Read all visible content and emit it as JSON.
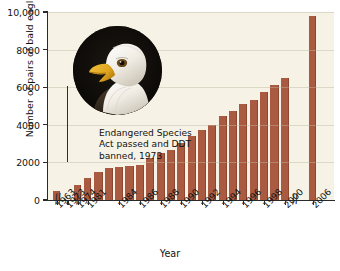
{
  "chart_data": {
    "type": "bar",
    "title": "",
    "xlabel": "Year",
    "ylabel": "Number of pairs of bald eagles",
    "ylim": [
      0,
      10000
    ],
    "ytick_labels": [
      "0",
      "2000",
      "4000",
      "6000",
      "8000",
      "10,000"
    ],
    "ytick_values": [
      0,
      2000,
      4000,
      6000,
      8000,
      10000
    ],
    "grid": false,
    "legend": "none",
    "bar_color": "#a95a41",
    "plot_background": "#f6f2e6",
    "axis_breaks": [
      "between 1963 and 1973",
      "between 1974 and 1981",
      "between 2000 and 2006"
    ],
    "categories": [
      "1963",
      "1973",
      "1974",
      "1981",
      "1982",
      "1983",
      "1984",
      "1985",
      "1986",
      "1987",
      "1988",
      "1989",
      "1990",
      "1991",
      "1992",
      "1993",
      "1994",
      "1995",
      "1996",
      "1997",
      "1998",
      "1999",
      "2000",
      "2006"
    ],
    "tick_labels": [
      "1963",
      "1973",
      "1974",
      "1981",
      "1984",
      "1986",
      "1988",
      "1990",
      "1992",
      "1994",
      "1996",
      "1998",
      "2000",
      "2006"
    ],
    "values": [
      487,
      0,
      791,
      1188,
      1480,
      1700,
      1757,
      1800,
      1875,
      2238,
      2475,
      2680,
      3035,
      3399,
      3749,
      4015,
      4449,
      4712,
      5094,
      5295,
      5748,
      6104,
      6471,
      9789
    ],
    "annotation": {
      "line1": "Endangered Species",
      "line2": "Act passed and DDT",
      "line3": "banned, 1973",
      "at_year": "1973"
    },
    "inset_image": {
      "name": "bald-eagle-photo",
      "shape": "circle",
      "description": "Photograph of a bald eagle head"
    }
  }
}
